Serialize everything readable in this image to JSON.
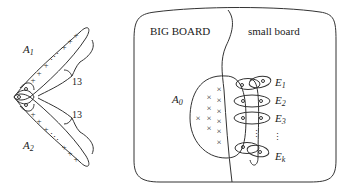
{
  "left_figure": {
    "labels": {
      "A1": {
        "main": "A",
        "sub": "1"
      },
      "A2": {
        "main": "A",
        "sub": "2"
      }
    },
    "brace_labels": [
      "13",
      "13"
    ],
    "point_symbol": "+",
    "shared_symbol": "o"
  },
  "right_figure": {
    "region_labels": {
      "big": "BIG BOARD",
      "small": "small board"
    },
    "A0": {
      "main": "A",
      "sub": "0"
    },
    "edges": [
      {
        "main": "E",
        "sub": "1"
      },
      {
        "main": "E",
        "sub": "2"
      },
      {
        "main": "E",
        "sub": "3"
      },
      {
        "main": "E",
        "sub": "k"
      }
    ],
    "cross_symbol": "×",
    "vertex_symbol": "o",
    "ellipsis": "⋮"
  }
}
